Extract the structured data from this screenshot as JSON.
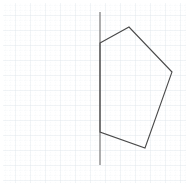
{
  "figure": {
    "canvas": {
      "width": 193,
      "height": 193,
      "background_color": "#ffffff"
    },
    "grid": {
      "description": "dotted-graph-paper",
      "minor_spacing": 5,
      "major_spacing": 15,
      "minor_color": "#e8eef2",
      "major_color": "#dfe7ec",
      "origin_x": 3,
      "origin_y": 3,
      "extent_x": 186,
      "extent_y": 183
    },
    "axis_line": {
      "name": "vertical-reference-line",
      "color": "#8c8c8c",
      "stroke_width": 1.4,
      "x": 100,
      "y_start": 12,
      "y_end": 165
    },
    "polygon": {
      "name": "pentagon",
      "sides": 5,
      "stroke_color": "#4a4a4a",
      "stroke_width": 1.1,
      "fill": "none",
      "vertices": [
        {
          "label": "A",
          "x": 100,
          "y": 43
        },
        {
          "label": "B",
          "x": 129,
          "y": 27
        },
        {
          "label": "C",
          "x": 172,
          "y": 72
        },
        {
          "label": "D",
          "x": 145,
          "y": 148
        },
        {
          "label": "E",
          "x": 100,
          "y": 132
        }
      ]
    }
  }
}
